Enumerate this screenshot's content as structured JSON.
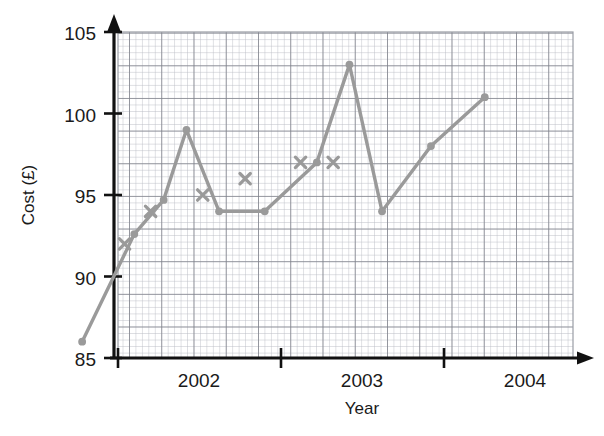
{
  "chart_data": {
    "type": "line",
    "title": "",
    "xlabel": "Year",
    "ylabel": "Cost (£)",
    "xlim": [
      2001.7,
      2004.45
    ],
    "ylim": [
      85,
      105
    ],
    "grid": "graph-paper minor 0.4 units, major 2 units",
    "legend": "none",
    "y_ticks": [
      85,
      90,
      95,
      100,
      105
    ],
    "x_ticks": [
      2002,
      2003,
      2004
    ],
    "x_tick_labels": [
      "2002",
      "2003",
      "2004"
    ],
    "series": [
      {
        "name": "Cost line",
        "marker": "dot",
        "color": "#9a9a9a",
        "points": [
          {
            "x": 2001.78,
            "y": 86
          },
          {
            "x": 2002.1,
            "y": 92.6
          },
          {
            "x": 2002.28,
            "y": 94.7
          },
          {
            "x": 2002.42,
            "y": 99
          },
          {
            "x": 2002.62,
            "y": 94
          },
          {
            "x": 2002.9,
            "y": 94
          },
          {
            "x": 2003.22,
            "y": 97
          },
          {
            "x": 2003.42,
            "y": 103
          },
          {
            "x": 2003.62,
            "y": 94
          },
          {
            "x": 2003.92,
            "y": 98
          },
          {
            "x": 2004.25,
            "y": 101
          }
        ]
      },
      {
        "name": "Cross markers",
        "marker": "x",
        "color": "#9a9a9a",
        "points": [
          {
            "x": 2002.04,
            "y": 92
          },
          {
            "x": 2002.2,
            "y": 94
          },
          {
            "x": 2002.52,
            "y": 95
          },
          {
            "x": 2002.78,
            "y": 96
          },
          {
            "x": 2003.12,
            "y": 97
          },
          {
            "x": 2003.32,
            "y": 97
          }
        ]
      }
    ],
    "colors": {
      "line": "#9a9a9a",
      "axis": "#111111",
      "grid_minor": "#b9bcc4",
      "grid_major": "#7d8089",
      "background": "#ffffff"
    }
  },
  "axes": {
    "y_label": "Cost (£)",
    "x_label": "Year",
    "y_ticks": [
      "105",
      "100",
      "95",
      "90",
      "85"
    ],
    "x_ticks": [
      "2002",
      "2003",
      "2004"
    ]
  }
}
